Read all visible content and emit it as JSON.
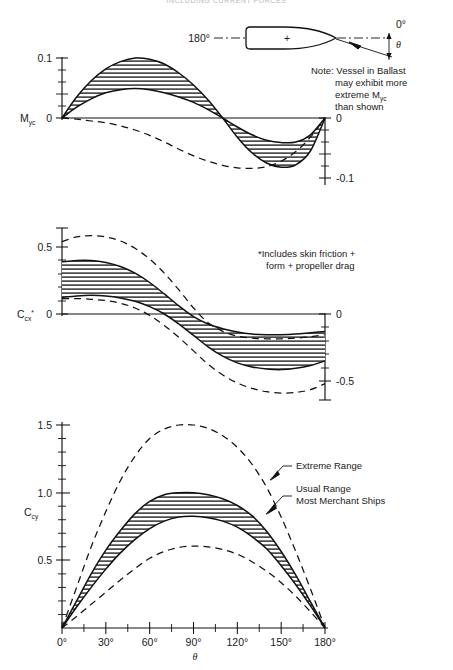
{
  "figure": {
    "header": "INCLUDING CURRENT FORCES",
    "page_width": 453,
    "page_height": 670
  },
  "ship_diagram": {
    "name": "vessel-heading-diagram",
    "stern_label": "180°",
    "bow_label": "0°",
    "angle_label": "θ",
    "center_mark": "+"
  },
  "notes": {
    "ballast_note": "Note: Vessel in Ballast may exhibit more extreme M   than shown",
    "ballast_note_lines": [
      "Note: Vessel in Ballast",
      "may exhibit more",
      "extreme M",
      "than shown"
    ],
    "ballast_note_symbol": "yc",
    "drag_note_lines": [
      "*Includes skin friction +",
      "form + propeller drag"
    ]
  },
  "annotations": {
    "extreme_range": "Extreme Range",
    "usual_range_line1": "Usual Range",
    "usual_range_line2": "Most Merchant Ships"
  },
  "chart_data": [
    {
      "id": "myc",
      "type": "area",
      "title": "",
      "ylabel": "M",
      "ylabel_sub": "yc",
      "xlabel": "θ",
      "xlim": [
        0,
        180
      ],
      "ylim": [
        -0.1,
        0.1
      ],
      "left_tick_labels": [
        "0.1",
        "0"
      ],
      "left_tick_values": [
        0.1,
        0.0
      ],
      "right_tick_labels": [
        "0",
        "-0.1"
      ],
      "right_tick_values": [
        0.0,
        -0.1
      ],
      "minor_ticks_per_major": 5,
      "grid": false,
      "legend": "none",
      "x": [
        0,
        10,
        20,
        30,
        40,
        50,
        60,
        70,
        80,
        90,
        100,
        110,
        120,
        130,
        140,
        150,
        160,
        170,
        180
      ],
      "series": [
        {
          "name": "Usual Range Upper",
          "style": "solid",
          "values": [
            0.0,
            0.035,
            0.062,
            0.082,
            0.094,
            0.1,
            0.098,
            0.09,
            0.075,
            0.055,
            0.03,
            0.0,
            -0.032,
            -0.058,
            -0.075,
            -0.082,
            -0.078,
            -0.055,
            0.0
          ]
        },
        {
          "name": "Usual Range Lower",
          "style": "solid",
          "values": [
            0.0,
            0.018,
            0.032,
            0.042,
            0.047,
            0.049,
            0.047,
            0.042,
            0.035,
            0.026,
            0.014,
            0.0,
            -0.015,
            -0.028,
            -0.037,
            -0.041,
            -0.04,
            -0.028,
            0.0
          ]
        },
        {
          "name": "Extreme Ballast",
          "style": "dashed",
          "values": [
            0.0,
            -0.002,
            -0.005,
            -0.008,
            -0.013,
            -0.02,
            -0.029,
            -0.04,
            -0.052,
            -0.063,
            -0.072,
            -0.079,
            -0.083,
            -0.084,
            -0.081,
            -0.072,
            -0.056,
            -0.032,
            0.0
          ]
        }
      ]
    },
    {
      "id": "ccx",
      "type": "area",
      "title": "",
      "ylabel": "C",
      "ylabel_sub": "cx",
      "ylabel_star": "*",
      "xlabel": "θ",
      "xlim": [
        0,
        180
      ],
      "ylim": [
        -0.65,
        0.65
      ],
      "left_tick_labels": [
        "0.5",
        "0"
      ],
      "left_tick_values": [
        0.5,
        0.0
      ],
      "right_tick_labels": [
        "0",
        "-0.5"
      ],
      "right_tick_values": [
        0.0,
        -0.5
      ],
      "minor_ticks_per_major": 5,
      "grid": false,
      "legend": "none",
      "x": [
        0,
        10,
        20,
        30,
        40,
        50,
        60,
        70,
        80,
        90,
        100,
        110,
        120,
        130,
        140,
        150,
        160,
        170,
        180
      ],
      "series": [
        {
          "name": "Usual Range Upper",
          "style": "solid",
          "values": [
            0.39,
            0.4,
            0.4,
            0.385,
            0.355,
            0.305,
            0.235,
            0.15,
            0.06,
            -0.02,
            -0.075,
            -0.11,
            -0.135,
            -0.15,
            -0.155,
            -0.155,
            -0.15,
            -0.14,
            -0.13
          ]
        },
        {
          "name": "Usual Range Lower",
          "style": "solid",
          "values": [
            0.125,
            0.135,
            0.14,
            0.135,
            0.12,
            0.095,
            0.055,
            0.0,
            -0.075,
            -0.16,
            -0.245,
            -0.315,
            -0.365,
            -0.395,
            -0.41,
            -0.415,
            -0.405,
            -0.385,
            -0.35
          ]
        },
        {
          "name": "Extreme Upper",
          "style": "dashed",
          "values": [
            0.54,
            0.575,
            0.585,
            0.575,
            0.545,
            0.49,
            0.41,
            0.305,
            0.18,
            0.045,
            -0.065,
            -0.13,
            -0.165,
            -0.18,
            -0.185,
            -0.185,
            -0.18,
            -0.17,
            -0.155
          ]
        },
        {
          "name": "Extreme Lower",
          "style": "dashed",
          "values": [
            0.115,
            0.115,
            0.11,
            0.1,
            0.08,
            0.045,
            -0.01,
            -0.085,
            -0.175,
            -0.275,
            -0.375,
            -0.455,
            -0.515,
            -0.555,
            -0.58,
            -0.59,
            -0.585,
            -0.565,
            -0.52
          ]
        }
      ]
    },
    {
      "id": "ccy",
      "type": "area",
      "title": "",
      "ylabel": "C",
      "ylabel_sub": "cy",
      "xlabel": "θ",
      "xlim": [
        0,
        180
      ],
      "ylim": [
        0,
        1.6
      ],
      "y_tick_labels": [
        "1.5",
        "1.0",
        "0.5"
      ],
      "y_tick_values": [
        1.5,
        1.0,
        0.5
      ],
      "x_tick_labels": [
        "0°",
        "30°",
        "60°",
        "90°",
        "120°",
        "150°",
        "180°"
      ],
      "x_tick_values": [
        0,
        30,
        60,
        90,
        120,
        150,
        180
      ],
      "minor_ticks_per_major": 5,
      "grid": false,
      "legend": "callouts",
      "x": [
        0,
        10,
        20,
        30,
        40,
        50,
        60,
        70,
        80,
        90,
        100,
        110,
        120,
        130,
        140,
        150,
        160,
        170,
        180
      ],
      "series": [
        {
          "name": "Usual Range Upper",
          "style": "solid",
          "values": [
            0.0,
            0.2,
            0.4,
            0.575,
            0.72,
            0.845,
            0.935,
            0.985,
            1.0,
            1.0,
            0.985,
            0.955,
            0.905,
            0.83,
            0.715,
            0.565,
            0.39,
            0.195,
            0.0
          ]
        },
        {
          "name": "Usual Range Lower",
          "style": "solid",
          "values": [
            0.0,
            0.155,
            0.3,
            0.435,
            0.555,
            0.655,
            0.735,
            0.79,
            0.82,
            0.825,
            0.815,
            0.79,
            0.745,
            0.675,
            0.585,
            0.46,
            0.32,
            0.165,
            0.0
          ]
        },
        {
          "name": "Extreme Range Upper",
          "style": "dashed",
          "values": [
            0.0,
            0.3,
            0.6,
            0.86,
            1.09,
            1.27,
            1.4,
            1.47,
            1.5,
            1.5,
            1.475,
            1.42,
            1.335,
            1.21,
            1.04,
            0.82,
            0.565,
            0.29,
            0.0
          ]
        },
        {
          "name": "Extreme Range Lower",
          "style": "dashed",
          "values": [
            0.0,
            0.085,
            0.175,
            0.265,
            0.355,
            0.44,
            0.515,
            0.565,
            0.595,
            0.605,
            0.6,
            0.58,
            0.545,
            0.49,
            0.42,
            0.335,
            0.235,
            0.12,
            0.0
          ]
        }
      ]
    }
  ]
}
